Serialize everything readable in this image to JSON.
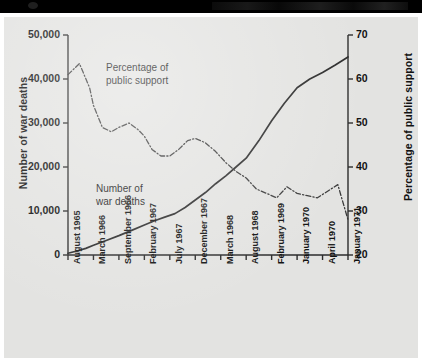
{
  "topbar": {
    "label": ""
  },
  "chart_data": {
    "type": "line",
    "title": "",
    "xlabel": "",
    "ylabel": "Number of war deaths",
    "y2label": "Percentage of public support",
    "ylim": [
      0,
      50000
    ],
    "y2lim": [
      20,
      70
    ],
    "grid": false,
    "legend": "annotations-inline",
    "y_ticks": [
      "0",
      "10,000",
      "20,000",
      "30,000",
      "40,000",
      "50,000"
    ],
    "y_tick_values": [
      0,
      10000,
      20000,
      30000,
      40000,
      50000
    ],
    "y2_ticks": [
      "20",
      "30",
      "40",
      "50",
      "60",
      "70"
    ],
    "y2_tick_values": [
      20,
      30,
      40,
      50,
      60,
      70
    ],
    "categories": [
      "August 1965",
      "March 1966",
      "September 1966",
      "February 1967",
      "July 1967",
      "December 1967",
      "March 1968",
      "August 1968",
      "February 1969",
      "January 1970",
      "April 1970",
      "January 1971"
    ],
    "annotations": [
      {
        "name": "percentage-of-public-support",
        "line1": "Percentage of",
        "line2": "public support"
      },
      {
        "name": "number-of-war-deaths",
        "line1": "Number of",
        "line2": "war deaths"
      }
    ],
    "series": [
      {
        "name": "Number of war deaths",
        "axis": "left",
        "style": "solid",
        "color": "#2a2a2a",
        "x": [
          0,
          0.35,
          0.7,
          1.0,
          1.5,
          2.0,
          2.5,
          3.0,
          3.4,
          3.8,
          4.2,
          4.6,
          5.0,
          5.4,
          5.8,
          6.2,
          6.6,
          7.0,
          7.5,
          8.0,
          8.5,
          9.0,
          9.5,
          10.0,
          10.5,
          11.0
        ],
        "values": [
          400,
          900,
          1500,
          2200,
          3300,
          4400,
          5600,
          6800,
          7800,
          8600,
          9400,
          10800,
          12500,
          14200,
          16200,
          18000,
          20000,
          22000,
          26000,
          30500,
          34500,
          38000,
          40000,
          41500,
          43200,
          45000
        ]
      },
      {
        "name": "Percentage of public support",
        "axis": "right",
        "style": "dash-dot",
        "color": "#3a3a3a",
        "x": [
          0,
          0.45,
          0.85,
          1.0,
          1.35,
          1.7,
          2.0,
          2.4,
          2.75,
          3.0,
          3.3,
          3.65,
          4.0,
          4.35,
          4.7,
          5.0,
          5.4,
          5.8,
          6.2,
          6.6,
          7.0,
          7.4,
          7.8,
          8.2,
          8.6,
          9.0,
          9.4,
          9.8,
          10.2,
          10.6,
          11.0
        ],
        "values": [
          61,
          63.5,
          58,
          54,
          49,
          48,
          49,
          50,
          48.5,
          47,
          44,
          42.5,
          42.5,
          44,
          46,
          46.5,
          45.5,
          43.5,
          41,
          39,
          37.5,
          35,
          34,
          33,
          35.5,
          34,
          33.5,
          33,
          34.5,
          36,
          28
        ]
      }
    ]
  }
}
